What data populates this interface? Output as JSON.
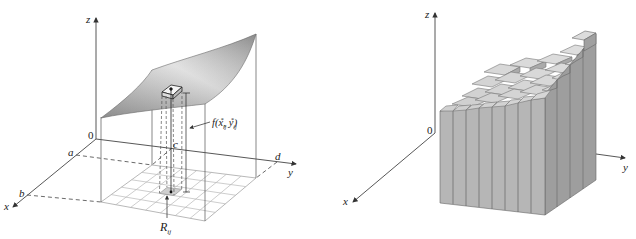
{
  "figures": [
    {
      "id": "left",
      "description": "Surface z = f(x,y) over rectangle R = [a,b] x [c,d] with subrectangle R_ij and column of height f(x_ij*, y_ij*)",
      "axes": {
        "x": "x",
        "y": "y",
        "z": "z",
        "origin": "0"
      },
      "bounds": {
        "a": "a",
        "b": "b",
        "c": "c",
        "d": "d"
      },
      "annotations": {
        "height_label_f": "f(x",
        "height_label_sub1": "ij",
        "height_label_sup1": "*",
        "height_label_sep": ", y",
        "height_label_sub2": "ij",
        "height_label_sup2": "*",
        "height_label_close": ")",
        "region_label": "R",
        "region_sub": "ij"
      },
      "grid": {
        "rows": 5,
        "cols": 7
      }
    },
    {
      "id": "right",
      "description": "Riemann sum approximation using rectangular boxes (columns) over the grid",
      "axes": {
        "x": "x",
        "y": "y",
        "z": "z",
        "origin": "0"
      },
      "grid": {
        "rows": 8,
        "cols": 8
      }
    }
  ],
  "colors": {
    "axis": "#444444",
    "surface_light": "#f2f2f2",
    "surface_dark": "#8c8c8c",
    "box_front": "#b4b4b4",
    "box_side": "#9a9a9a",
    "box_top": "#d8d8d8",
    "grid": "#b0b0b0"
  }
}
